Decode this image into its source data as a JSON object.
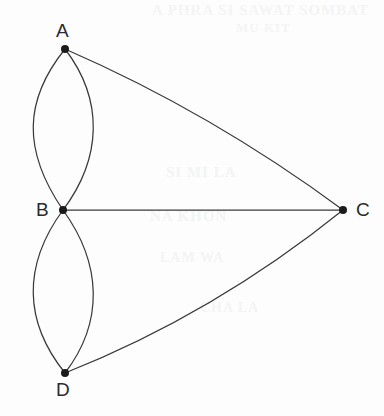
{
  "diagram": {
    "background_color": "#fdfdfd",
    "edge_color": "#3a3a3c",
    "node_color": "#1b1b1d",
    "label_color": "#2b2b2d",
    "width": 384,
    "height": 416
  },
  "nodes": [
    {
      "id": "A",
      "label": "A",
      "x": 65,
      "y": 49,
      "label_x": 56,
      "label_y": 21,
      "label_position": "above",
      "radius": 4
    },
    {
      "id": "B",
      "label": "B",
      "x": 63,
      "y": 210,
      "label_x": 36,
      "label_y": 200,
      "label_position": "left",
      "radius": 4
    },
    {
      "id": "C",
      "label": "C",
      "x": 343,
      "y": 210,
      "label_x": 356,
      "label_y": 200,
      "label_position": "right",
      "radius": 4
    },
    {
      "id": "D",
      "label": "D",
      "x": 65,
      "y": 373,
      "label_x": 56,
      "label_y": 380,
      "label_position": "below",
      "radius": 4
    }
  ],
  "edges": [
    {
      "id": "AB-left",
      "from": "A",
      "to": "B",
      "shape": "curve",
      "bulge": "left",
      "path": "M 65 49 C 24 100 22 150 63 210"
    },
    {
      "id": "AB-right",
      "from": "A",
      "to": "B",
      "shape": "curve",
      "bulge": "right",
      "path": "M 65 49 C 104 100 102 158 63 210"
    },
    {
      "id": "BD-left",
      "from": "B",
      "to": "D",
      "shape": "curve",
      "bulge": "left",
      "path": "M 63 210 C 22 266 24 322 65 373"
    },
    {
      "id": "BD-right",
      "from": "B",
      "to": "D",
      "shape": "curve",
      "bulge": "right",
      "path": "M 63 210 C 102 264 104 322 65 373"
    },
    {
      "id": "AC",
      "from": "A",
      "to": "C",
      "shape": "curve",
      "bulge": "up",
      "path": "M 65 49 Q 212 113 343 210"
    },
    {
      "id": "BC",
      "from": "B",
      "to": "C",
      "shape": "line",
      "bulge": "none",
      "path": "M 63 210 L 343 210"
    },
    {
      "id": "DC",
      "from": "D",
      "to": "C",
      "shape": "curve",
      "bulge": "down",
      "path": "M 65 373 Q 214 314 343 210"
    }
  ],
  "artifacts": {
    "enabled": true,
    "description": "faint reverse-side print bleed-through from scan",
    "lines": [
      "A PHRA SI SAWAT SOMBAT",
      "MU KIT",
      "SI MI LA",
      "NA KHON",
      "LAM WA",
      "CHA LA"
    ]
  }
}
